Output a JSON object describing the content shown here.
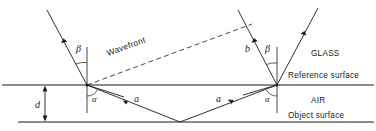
{
  "figure": {
    "background_color": "#ffffff",
    "ink_color": "#1a1a1a"
  },
  "regions": {
    "glass_label": "GLASS",
    "air_label": "AIR"
  },
  "surfaces": {
    "reference_label": "Reference surface",
    "object_label": "Object surface"
  },
  "annotations": {
    "wavefront_label": "Wavefront",
    "beta_left": "β",
    "beta_right": "β",
    "alpha_left": "α",
    "alpha_right": "α",
    "gap_label": "d",
    "ray_a_left": "a",
    "ray_a_right": "a",
    "ray_b": "b"
  },
  "geometry": {
    "reference_surface_y": 85,
    "object_surface_y": 122,
    "left_node_x": 87,
    "right_node_x": 277,
    "vertex_x": 180
  }
}
